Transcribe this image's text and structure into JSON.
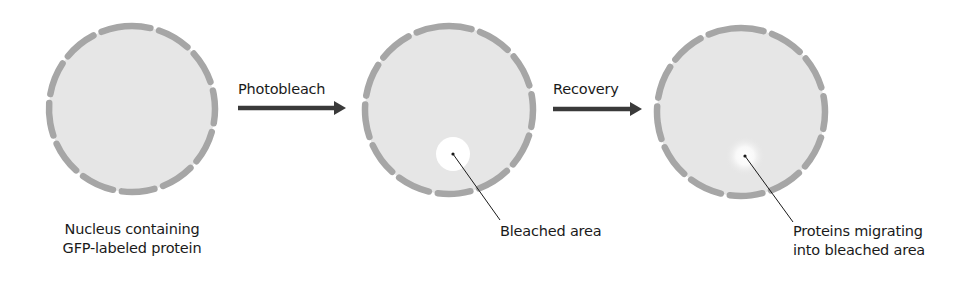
{
  "colors": {
    "nucleus_fill": "#e6e6e6",
    "envelope": "#a6a6a6",
    "arrow": "#3a3a3a",
    "leader_line": "#1a1a1a",
    "bleach_spot": "#ffffff"
  },
  "stages": [
    {
      "name": "initial",
      "caption_lines": [
        "Nucleus containing",
        "GFP-labeled protein"
      ]
    },
    {
      "name": "photobleached",
      "callout": "Bleached area"
    },
    {
      "name": "recovery",
      "callout_lines": [
        "Proteins migrating",
        "into bleached area"
      ]
    }
  ],
  "arrows": [
    {
      "label": "Photobleach"
    },
    {
      "label": "Recovery"
    }
  ]
}
